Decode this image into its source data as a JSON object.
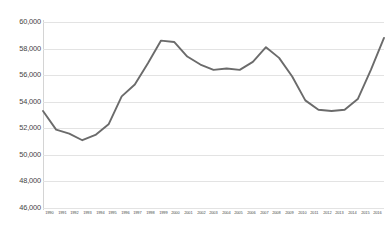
{
  "chart_data": {
    "type": "line",
    "title": "",
    "subtitle": "",
    "xlabel": "",
    "ylabel": "",
    "grid": true,
    "legend": false,
    "legend_position": "none",
    "line_color": "#6b6b6b",
    "gridline_color": "#e3e3e3",
    "axis_color": "#d4d4d4",
    "background_color": "#ffffff",
    "categories": [
      "1990",
      "1991",
      "1992",
      "1993",
      "1994",
      "1995",
      "1996",
      "1997",
      "1998",
      "1999",
      "2000",
      "2001",
      "2002",
      "2003",
      "2004",
      "2005",
      "2006",
      "2007",
      "2008",
      "2009",
      "2010",
      "2011",
      "2012",
      "2013",
      "2014",
      "2015",
      "2016"
    ],
    "values": [
      53300,
      51900,
      51600,
      51100,
      51500,
      52300,
      54400,
      55300,
      56900,
      58600,
      58500,
      57400,
      56800,
      56400,
      56500,
      56400,
      57000,
      58100,
      57300,
      55900,
      54100,
      53400,
      53300,
      53400,
      54200,
      56400,
      58800
    ],
    "ylim": [
      46000,
      60000
    ],
    "ytick_values": [
      60000,
      58000,
      56000,
      54000,
      52000,
      50000,
      48000,
      46000
    ],
    "ytick_labels": [
      "60,000",
      "58,000",
      "56,000",
      "54,000",
      "52,000",
      "50,000",
      "48,000",
      "46,000"
    ],
    "ytick_step": 2000,
    "xlim": [
      "1990",
      "2016"
    ],
    "series": [
      {
        "name": "",
        "values": [
          53300,
          51900,
          51600,
          51100,
          51500,
          52300,
          54400,
          55300,
          56900,
          58600,
          58500,
          57400,
          56800,
          56400,
          56500,
          56400,
          57000,
          58100,
          57300,
          55900,
          54100,
          53400,
          53300,
          53400,
          54200,
          56400,
          58800
        ]
      }
    ],
    "annotations": []
  }
}
